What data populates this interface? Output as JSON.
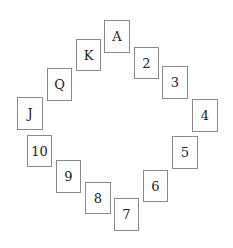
{
  "diagram": {
    "type": "card-rank-circle",
    "cards": [
      {
        "label": "A",
        "x": 104,
        "y": 20,
        "w": 26,
        "h": 33
      },
      {
        "label": "2",
        "x": 134,
        "y": 47,
        "w": 25,
        "h": 32
      },
      {
        "label": "3",
        "x": 162,
        "y": 66,
        "w": 26,
        "h": 33
      },
      {
        "label": "4",
        "x": 192,
        "y": 99,
        "w": 26,
        "h": 33
      },
      {
        "label": "5",
        "x": 172,
        "y": 136,
        "w": 26,
        "h": 33
      },
      {
        "label": "6",
        "x": 143,
        "y": 170,
        "w": 25,
        "h": 32
      },
      {
        "label": "7",
        "x": 114,
        "y": 198,
        "w": 25,
        "h": 33
      },
      {
        "label": "8",
        "x": 85,
        "y": 182,
        "w": 26,
        "h": 32
      },
      {
        "label": "9",
        "x": 56,
        "y": 160,
        "w": 25,
        "h": 33
      },
      {
        "label": "10",
        "x": 27,
        "y": 135,
        "w": 25,
        "h": 32
      },
      {
        "label": "J",
        "x": 17,
        "y": 97,
        "w": 26,
        "h": 33
      },
      {
        "label": "Q",
        "x": 47,
        "y": 68,
        "w": 25,
        "h": 33
      },
      {
        "label": "K",
        "x": 76,
        "y": 39,
        "w": 25,
        "h": 32
      }
    ]
  }
}
